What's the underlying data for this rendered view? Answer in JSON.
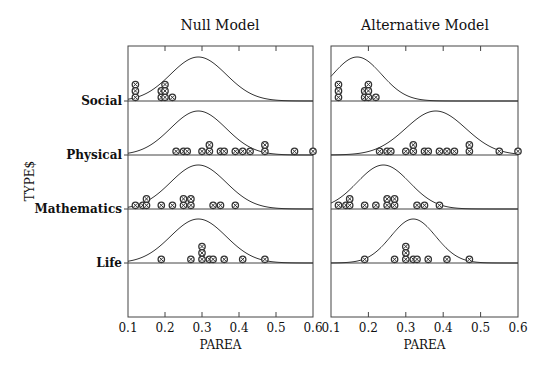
{
  "figure": {
    "y_axis_title": "TYPE$",
    "x_axis_title": "PAREA"
  },
  "chart_data": {
    "type": "dot-density",
    "xlabel": "PAREA",
    "ylabel": "TYPE$",
    "xlim": [
      0.1,
      0.6
    ],
    "xticks": [
      "0.1",
      "0.2",
      "0.3",
      "0.4",
      "0.5",
      "0.6"
    ],
    "categories": [
      "Social",
      "Physical",
      "Mathematics",
      "Life"
    ],
    "data_points": {
      "Social": [
        0.12,
        0.12,
        0.12,
        0.19,
        0.19,
        0.2,
        0.2,
        0.2,
        0.22
      ],
      "Physical": [
        0.23,
        0.25,
        0.26,
        0.3,
        0.32,
        0.32,
        0.35,
        0.36,
        0.39,
        0.41,
        0.43,
        0.47,
        0.47,
        0.55,
        0.6
      ],
      "Mathematics": [
        0.12,
        0.14,
        0.15,
        0.15,
        0.19,
        0.22,
        0.25,
        0.25,
        0.27,
        0.27,
        0.33,
        0.35,
        0.39
      ],
      "Life": [
        0.19,
        0.27,
        0.3,
        0.3,
        0.3,
        0.32,
        0.33,
        0.36,
        0.41,
        0.47
      ]
    },
    "panels": [
      {
        "title": "Null Model",
        "curves": {
          "Social": {
            "mean": 0.29,
            "sd": 0.075
          },
          "Physical": {
            "mean": 0.29,
            "sd": 0.075
          },
          "Mathematics": {
            "mean": 0.29,
            "sd": 0.075
          },
          "Life": {
            "mean": 0.29,
            "sd": 0.075
          }
        }
      },
      {
        "title": "Alternative Model",
        "curves": {
          "Social": {
            "mean": 0.17,
            "sd": 0.065
          },
          "Physical": {
            "mean": 0.38,
            "sd": 0.08
          },
          "Mathematics": {
            "mean": 0.24,
            "sd": 0.07
          },
          "Life": {
            "mean": 0.32,
            "sd": 0.06
          }
        }
      }
    ],
    "grid": false,
    "legend": "none"
  }
}
